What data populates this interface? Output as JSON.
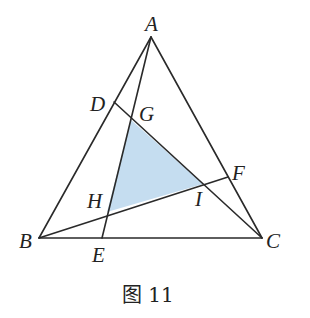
{
  "figure": {
    "caption": "图 11",
    "colors": {
      "line": "#2a2a2a",
      "shade": "#c5ddf0",
      "label": "#222222",
      "background": "#ffffff"
    },
    "points": {
      "A": {
        "label": "A",
        "x": 151,
        "y": 37
      },
      "B": {
        "label": "B",
        "x": 39,
        "y": 238
      },
      "C": {
        "label": "C",
        "x": 262,
        "y": 238
      },
      "D": {
        "label": "D",
        "x": 114,
        "y": 102
      },
      "E": {
        "label": "E",
        "x": 102,
        "y": 238
      },
      "F": {
        "label": "F",
        "x": 228,
        "y": 177
      },
      "G": {
        "label": "G",
        "x": 131,
        "y": 120
      },
      "H": {
        "label": "H",
        "x": 107,
        "y": 212
      },
      "I": {
        "label": "I",
        "x": 203,
        "y": 184
      }
    },
    "segments": [
      {
        "from": "A",
        "to": "B"
      },
      {
        "from": "B",
        "to": "C"
      },
      {
        "from": "C",
        "to": "A"
      },
      {
        "from": "A",
        "to": "E"
      },
      {
        "from": "D",
        "to": "C"
      },
      {
        "from": "B",
        "to": "F"
      }
    ],
    "shaded_triangle": [
      "G",
      "H",
      "I"
    ]
  }
}
